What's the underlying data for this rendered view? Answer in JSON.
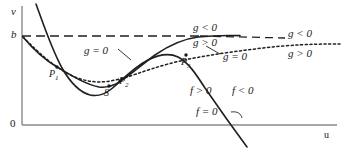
{
  "figure": {
    "title": "",
    "axes": {
      "y_label": "v",
      "x_label": "u",
      "origin_label": "0",
      "y_tick_label": "b"
    },
    "points": [
      {
        "id": "P1",
        "label": "P",
        "sub": "1",
        "x": 57,
        "y": 67
      },
      {
        "id": "S",
        "label": "S",
        "sub": "",
        "x": 109,
        "y": 86
      },
      {
        "id": "P2",
        "label": "P",
        "sub": "2",
        "x": 124,
        "y": 78
      },
      {
        "id": "P3",
        "label": "P",
        "sub": "3",
        "x": 189,
        "y": 59
      }
    ],
    "region_labels": [
      {
        "id": "g-lt-0-mid",
        "text": "g < 0",
        "x": 208,
        "y": 26
      },
      {
        "id": "g-gt-0-mid",
        "text": "g > 0",
        "x": 208,
        "y": 40
      },
      {
        "id": "g-lt-0-right",
        "text": "g < 0",
        "x": 303,
        "y": 33
      },
      {
        "id": "g-gt-0-right",
        "text": "g > 0",
        "x": 303,
        "y": 52
      },
      {
        "id": "g-eq-0-left",
        "text": "g = 0",
        "x": 98,
        "y": 50
      },
      {
        "id": "g-eq-0-right",
        "text": "g = 0",
        "x": 225,
        "y": 57
      },
      {
        "id": "f-gt-0",
        "text": "f > 0",
        "x": 203,
        "y": 90
      },
      {
        "id": "f-lt-0",
        "text": "f < 0",
        "x": 243,
        "y": 90
      },
      {
        "id": "f-eq-0",
        "text": "f = 0",
        "x": 208,
        "y": 116
      }
    ],
    "curves": {
      "f_zero": "solid cubic-like curve: steep descent from top-left, minimum near u=65, rises to maximum near u=178, then steep descent crossing the u-axis near u=262",
      "g_zero_dotted": "dotted curve from b descending to a shallow minimum near u=88, rising through P2/P3 and flattening toward the right",
      "b_dashed": "horizontal dashed line at v=b",
      "second_solid": "solid curve from b descending through P1 to a minimum near u=95 and rising asymptotically toward the b level"
    },
    "colors": {
      "ink": "#1a1a1a",
      "axis": "#808080",
      "background": "#ffffff"
    }
  }
}
